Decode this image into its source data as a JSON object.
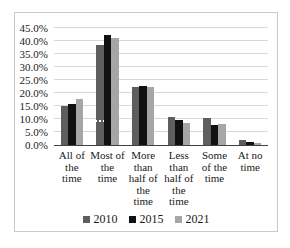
{
  "chart_data": {
    "type": "bar",
    "title": "",
    "xlabel": "",
    "ylabel": "",
    "ylim": [
      0,
      45
    ],
    "ytick_step": 5,
    "ytick_labels_top_to_bottom": [
      "45.0%",
      "40.0%",
      "35.0%",
      "30.0%",
      "25.0%",
      "20.0%",
      "15.0%",
      "10.0%",
      "5.0%",
      "0.0%"
    ],
    "grid": true,
    "legend_position": "bottom",
    "categories": [
      "All of the time",
      "Most of the time",
      "More than half of the time",
      "Less than half of the time",
      "Some of the time",
      "At no time"
    ],
    "category_display_lines": [
      "All of\nthe\ntime",
      "Most of\nthe\ntime",
      "More\nthan\nhalf of\nthe\ntime",
      "Less\nthan\nhalf of\nthe\ntime",
      "Some\nof the\ntime",
      "At no\ntime"
    ],
    "series": [
      {
        "name": "2010",
        "color": "#5e5e5e",
        "values": [
          15.0,
          38.6,
          22.3,
          10.8,
          10.3,
          1.9
        ]
      },
      {
        "name": "2015",
        "color": "#111111",
        "values": [
          15.8,
          42.2,
          22.8,
          9.6,
          7.9,
          1.3
        ]
      },
      {
        "name": "2021",
        "color": "#a6a6a6",
        "values": [
          17.6,
          41.0,
          22.5,
          8.6,
          8.1,
          0.7
        ]
      }
    ],
    "annotations": [
      {
        "type": "white-dash-mark",
        "series": "2010",
        "category": "Most of the time",
        "y_value": 8.8
      }
    ]
  },
  "colors": {
    "background": "#ffffff",
    "frame_border": "#c9c9c9",
    "gridline": "#d9d9d9",
    "axis_line": "#404040",
    "text": "#1a1a1a"
  }
}
